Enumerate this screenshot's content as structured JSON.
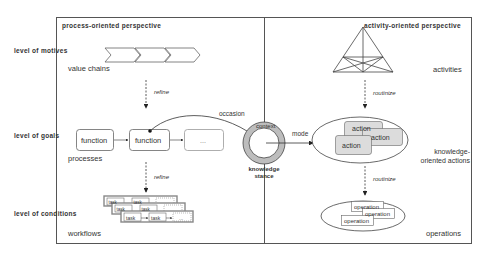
{
  "levels": {
    "motives": "level of motives",
    "goals": "level of goals",
    "conditions": "level of conditions"
  },
  "left_panel": {
    "title": "process-oriented perspective",
    "value_chains_label": "value chains",
    "refine_1": "refine",
    "functions": [
      "function",
      "function",
      "..."
    ],
    "processes_label": "processes",
    "refine_2": "refine",
    "tasks": [
      "task",
      "task",
      "..."
    ],
    "workflows_label": "workflows"
  },
  "center": {
    "occasion_label": "occasion",
    "context_label": "context",
    "knowledge_stance_label": "knowledge stance",
    "mode_label": "mode"
  },
  "right_panel": {
    "title": "activity-oriented perspective",
    "activities_label": "activities",
    "routinize_1": "routinize",
    "actions": [
      "action",
      "action",
      "action"
    ],
    "knowledge_actions_label": "knowledge-oriented actions",
    "routinize_2": "routinize",
    "operations": [
      "operation",
      "operation",
      "operation"
    ],
    "operations_label": "operations"
  },
  "colors": {
    "frame": "#555555",
    "stance_ring": "#bdbdbd",
    "action_fill": "#dcdcdc",
    "task_frame": "#8a8a8a"
  }
}
